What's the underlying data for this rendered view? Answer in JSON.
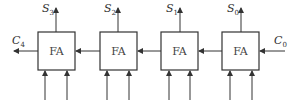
{
  "diagram": {
    "type": "ripple-carry-adder",
    "blocks": [
      {
        "label": "FA",
        "sum": {
          "base": "S",
          "sub": "3"
        }
      },
      {
        "label": "FA",
        "sum": {
          "base": "S",
          "sub": "2"
        }
      },
      {
        "label": "FA",
        "sum": {
          "base": "S",
          "sub": "1"
        }
      },
      {
        "label": "FA",
        "sum": {
          "base": "S",
          "sub": "0"
        }
      }
    ],
    "carry_out": {
      "base": "C",
      "sub": "4"
    },
    "carry_in": {
      "base": "C",
      "sub": "0"
    },
    "colors": {
      "stroke": "#333333",
      "background": "#ffffff"
    }
  }
}
